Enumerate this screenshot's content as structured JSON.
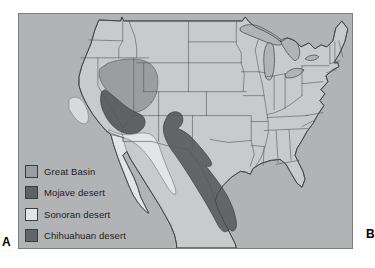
{
  "figure": {
    "panel_labels": {
      "a": "A",
      "b": "B"
    }
  },
  "map": {
    "colors": {
      "ocean": "#b1b3b5",
      "land": "#c9cacc",
      "outline": "#3f4143",
      "state_border": "#55585a",
      "valley": "#d9dadb",
      "frame": "#7b7d7f"
    }
  },
  "legend": {
    "items": [
      {
        "label": "Great Basin",
        "color": "#9b9da0"
      },
      {
        "label": "Mojave desert",
        "color": "#5f6164"
      },
      {
        "label": "Sonoran desert",
        "color": "#e3e4e5"
      },
      {
        "label": "Chihuahuan desert",
        "color": "#636568"
      }
    ]
  }
}
